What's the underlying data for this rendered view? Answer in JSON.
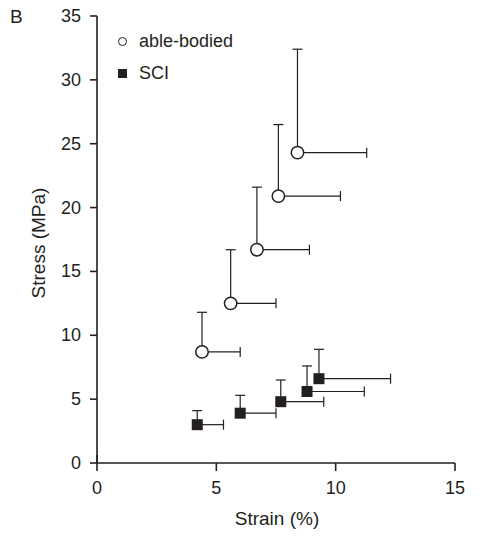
{
  "panel": {
    "label": "B"
  },
  "legend": {
    "position": "top-left-inside",
    "entries": [
      {
        "marker": "open-circle",
        "label": "able-bodied"
      },
      {
        "marker": "filled-square",
        "label": "SCI"
      }
    ]
  },
  "axes": {
    "x": {
      "title": "Strain (%)",
      "ticks": [
        "0",
        "5",
        "10",
        "15"
      ],
      "min": 0,
      "max": 15
    },
    "y": {
      "title": "Stress (MPa)",
      "ticks": [
        "0",
        "5",
        "10",
        "15",
        "20",
        "25",
        "30",
        "35"
      ],
      "min": 0,
      "max": 35
    }
  },
  "colors": {
    "ink": "#231f20",
    "background": "#ffffff",
    "marker_fill_open": "#ffffff",
    "marker_fill_closed": "#231f20"
  },
  "chart_data": {
    "type": "scatter",
    "title": "",
    "xlabel": "Strain (%)",
    "ylabel": "Stress (MPa)",
    "xlim": [
      0,
      15
    ],
    "ylim": [
      0,
      35
    ],
    "grid": false,
    "legend_position": "upper left",
    "series": [
      {
        "name": "able-bodied",
        "marker": "open-circle",
        "points": [
          {
            "x": 4.4,
            "y": 8.7,
            "xerr": 1.6,
            "yerr": 3.1
          },
          {
            "x": 5.6,
            "y": 12.5,
            "xerr": 1.9,
            "yerr": 4.2
          },
          {
            "x": 6.7,
            "y": 16.7,
            "xerr": 2.2,
            "yerr": 4.9
          },
          {
            "x": 7.6,
            "y": 20.9,
            "xerr": 2.6,
            "yerr": 5.6
          },
          {
            "x": 8.4,
            "y": 24.3,
            "xerr": 2.9,
            "yerr": 8.1
          }
        ]
      },
      {
        "name": "SCI",
        "marker": "filled-square",
        "points": [
          {
            "x": 4.2,
            "y": 3.0,
            "xerr": 1.1,
            "yerr": 1.1
          },
          {
            "x": 6.0,
            "y": 3.9,
            "xerr": 1.5,
            "yerr": 1.4
          },
          {
            "x": 7.7,
            "y": 4.8,
            "xerr": 1.8,
            "yerr": 1.7
          },
          {
            "x": 8.8,
            "y": 5.6,
            "xerr": 2.4,
            "yerr": 2.0
          },
          {
            "x": 9.3,
            "y": 6.6,
            "xerr": 3.0,
            "yerr": 2.3
          }
        ]
      }
    ]
  }
}
